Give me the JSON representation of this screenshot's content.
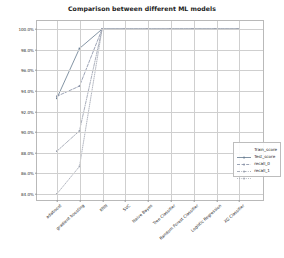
{
  "chart_data": {
    "type": "line",
    "title": "Comparison between different ML models",
    "xlabel": "",
    "ylabel": "",
    "grid": true,
    "legend_position": "center right",
    "ylim": [
      83.2,
      100.8
    ],
    "yticks": [
      "84.0%",
      "86.0%",
      "88.0%",
      "90.0%",
      "92.0%",
      "94.0%",
      "96.0%",
      "98.0%",
      "100.0%"
    ],
    "ytick_values": [
      84.0,
      86.0,
      88.0,
      90.0,
      92.0,
      94.0,
      96.0,
      98.0,
      100.0
    ],
    "categories": [
      "adaboost",
      "gradient boosting",
      "KNN",
      "SVC",
      "Naive Bayes",
      "Tree Classifier",
      "Random Forest Classifier",
      "Logistic Regression",
      "XG Classifier"
    ],
    "series": [
      {
        "name": "Train_score",
        "color": "#6b7f93",
        "linestyle": "solid",
        "marker": "square",
        "values": [
          93.2,
          98.1,
          100.0,
          100.0,
          100.0,
          100.0,
          100.0,
          100.0,
          100.0
        ]
      },
      {
        "name": "Test_score",
        "color": "#8a93a8",
        "linestyle": "dashed",
        "marker": "square",
        "values": [
          93.4,
          94.4,
          100.0,
          100.0,
          100.0,
          100.0,
          100.0,
          100.0,
          100.0
        ]
      },
      {
        "name": "recall_0",
        "color": "#9aa0ae",
        "linestyle": "dashdot",
        "marker": "square",
        "values": [
          88.0,
          90.0,
          100.0,
          100.0,
          100.0,
          100.0,
          100.0,
          100.0,
          100.0
        ]
      },
      {
        "name": "recall_1",
        "color": "#a3a8b4",
        "linestyle": "dotted",
        "marker": "square",
        "values": [
          83.8,
          86.5,
          100.0,
          100.0,
          100.0,
          100.0,
          100.0,
          100.0,
          100.0
        ]
      }
    ]
  },
  "legend": {
    "entries": [
      "Train_score",
      "Test_score",
      "recall_0",
      "recall_1"
    ]
  }
}
